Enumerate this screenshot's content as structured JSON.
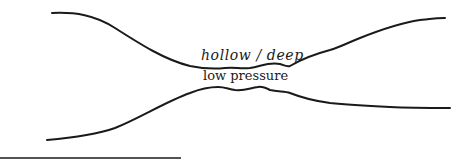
{
  "diagram": {
    "labels": {
      "upper": "hollow / deep",
      "lower": "low pressure"
    },
    "stroke_color": "#1a1a1a"
  }
}
